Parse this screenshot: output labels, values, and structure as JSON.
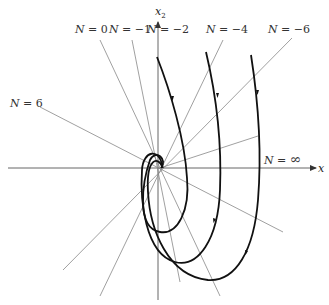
{
  "figure": {
    "type": "phase-plane isocline diagram",
    "axes": {
      "horizontal_label": "x",
      "vertical_label": "x",
      "vertical_subscript": "2"
    },
    "isoclines": [
      {
        "id": "n0",
        "label_var": "N",
        "label_eq": " = ",
        "label_val": "0",
        "x": 52,
        "y": 28
      },
      {
        "id": "n-1",
        "label_var": "N",
        "label_eq": " = ",
        "label_val": "−1",
        "x": 108,
        "y": 28
      },
      {
        "id": "n-2",
        "label_var": "N",
        "label_eq": " = ",
        "label_val": "−2",
        "x": 147,
        "y": 28
      },
      {
        "id": "n-4",
        "label_var": "N",
        "label_eq": " = ",
        "label_val": "−4",
        "x": 205,
        "y": 28
      },
      {
        "id": "n-6",
        "label_var": "N",
        "label_eq": " = ",
        "label_val": "−6",
        "x": 268,
        "y": 28
      },
      {
        "id": "n6",
        "label_var": "N",
        "label_eq": " = ",
        "label_val": "6",
        "x": 10,
        "y": 100
      },
      {
        "id": "ninf",
        "label_var": "N",
        "label_eq": " = ",
        "label_val": "∞",
        "x": 262,
        "y": 154
      }
    ],
    "trajectories": [
      {
        "id": "traj-inner",
        "start": "near N=-2 line top",
        "direction": "downward, spirals into origin"
      },
      {
        "id": "traj-middle",
        "start": "near N=-4 line top",
        "direction": "downward, spirals into origin"
      },
      {
        "id": "traj-outer",
        "start": "near N=-6 line top",
        "direction": "downward, spirals into origin"
      }
    ],
    "colors": {
      "curve": "#111111",
      "isocline": "#777777",
      "axis": "#555555"
    }
  }
}
